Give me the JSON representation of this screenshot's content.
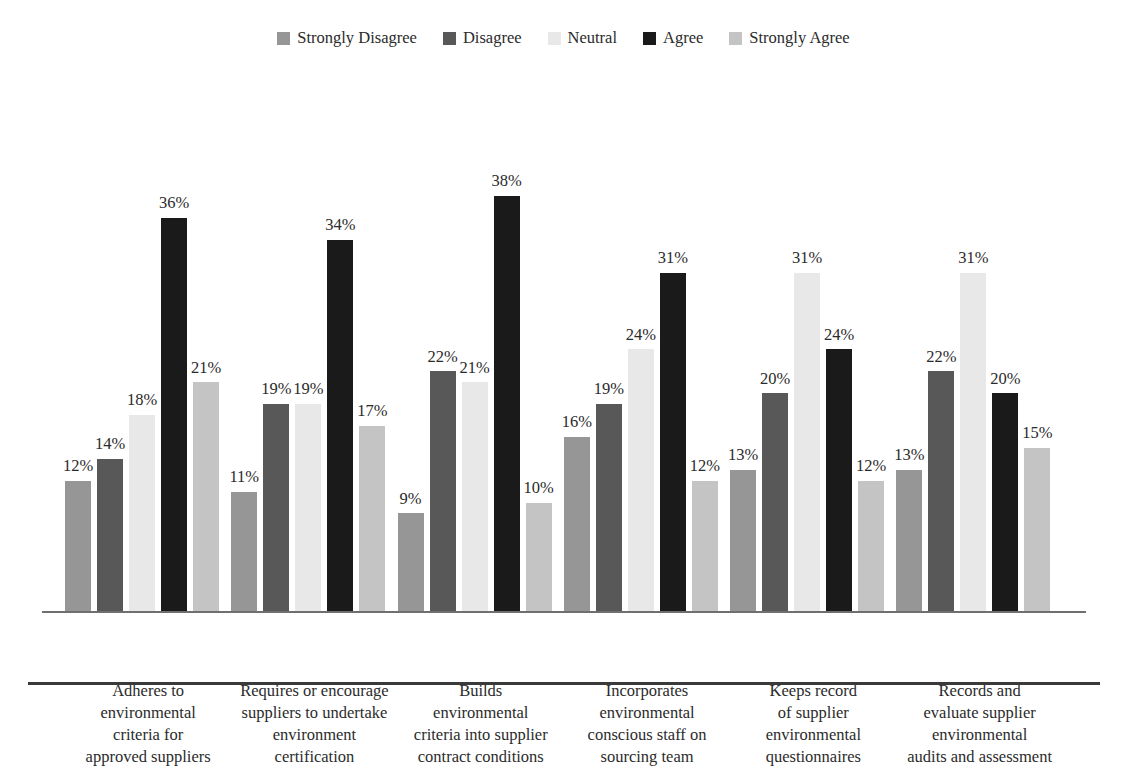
{
  "chart_data": {
    "type": "bar",
    "title": "",
    "subtitle": "",
    "xlabel": "",
    "ylabel": "",
    "ylim": [
      0,
      40
    ],
    "grid": false,
    "legend_position": "top-center",
    "value_suffix": "%",
    "categories": [
      "Adheres to environmental criteria for approved suppliers",
      "Requires or encourage suppliers to undertake environment certification",
      "Builds environmental criteria into supplier contract conditions",
      "Incorporates environmental conscious staff on sourcing team",
      "Keeps record of supplier environmental questionnaires",
      "Records and evaluate supplier environmental audits and assessment"
    ],
    "series": [
      {
        "name": "Strongly Disagree",
        "color": "#969696",
        "values": [
          12,
          11,
          9,
          16,
          13,
          13
        ]
      },
      {
        "name": "Disagree",
        "color": "#585858",
        "values": [
          14,
          19,
          22,
          19,
          20,
          22
        ]
      },
      {
        "name": "Neutral",
        "color": "#e8e8e8",
        "values": [
          18,
          19,
          21,
          24,
          31,
          31
        ]
      },
      {
        "name": "Agree",
        "color": "#1a1a1a",
        "values": [
          36,
          34,
          38,
          31,
          24,
          20
        ]
      },
      {
        "name": "Strongly Agree",
        "color": "#c4c4c4",
        "values": [
          21,
          17,
          10,
          12,
          12,
          15
        ]
      }
    ],
    "labels": [
      [
        "12%",
        "14%",
        "18%",
        "36%",
        "21%"
      ],
      [
        "11%",
        "19%",
        "19%",
        "34%",
        "17%"
      ],
      [
        "9%",
        "22%",
        "21%",
        "38%",
        "10%"
      ],
      [
        "16%",
        "19%",
        "24%",
        "31%",
        "12%"
      ],
      [
        "13%",
        "20%",
        "31%",
        "24%",
        "12%"
      ],
      [
        "13%",
        "22%",
        "31%",
        "20%",
        "15%"
      ]
    ],
    "category_lines": [
      [
        "Adheres to",
        "environmental",
        "criteria for",
        "approved suppliers"
      ],
      [
        "Requires or encourage",
        "suppliers to undertake",
        "environment",
        "certification"
      ],
      [
        "Builds",
        "environmental",
        "criteria into supplier",
        "contract conditions"
      ],
      [
        "Incorporates",
        "environmental",
        "conscious staff on",
        "sourcing team"
      ],
      [
        "Keeps record",
        "of supplier",
        "environmental",
        "questionnaires"
      ],
      [
        "Records and",
        "evaluate supplier",
        "environmental",
        "audits and assessment"
      ]
    ]
  }
}
